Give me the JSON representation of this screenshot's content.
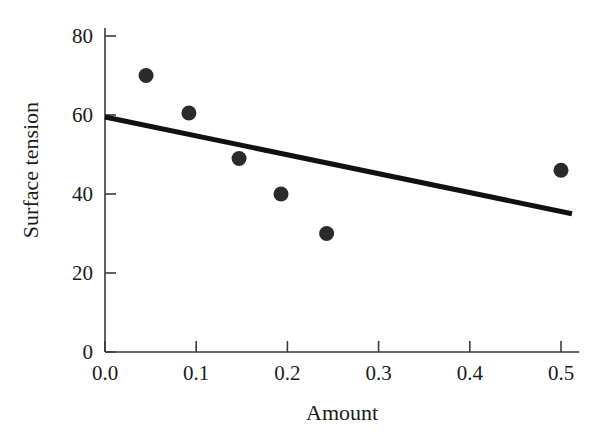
{
  "chart_data": {
    "type": "scatter",
    "title": "",
    "xlabel": "Amount",
    "ylabel": "Surface tension",
    "xlim": [
      0.0,
      0.52
    ],
    "ylim": [
      0,
      82
    ],
    "grid": false,
    "legend": "none",
    "x_ticks": [
      "0.0",
      "0.1",
      "0.2",
      "0.3",
      "0.4",
      "0.5"
    ],
    "x_tick_values": [
      0.0,
      0.1,
      0.2,
      0.3,
      0.4,
      0.5
    ],
    "y_ticks": [
      "0",
      "20",
      "40",
      "60",
      "80"
    ],
    "y_tick_values": [
      0,
      20,
      40,
      60,
      80
    ],
    "series": [
      {
        "name": "observations",
        "type": "scatter",
        "marker": "filled-circle",
        "color": "#2b2b2b",
        "points": [
          {
            "x": 0.045,
            "y": 70
          },
          {
            "x": 0.092,
            "y": 60.5
          },
          {
            "x": 0.147,
            "y": 49
          },
          {
            "x": 0.193,
            "y": 40
          },
          {
            "x": 0.243,
            "y": 30
          },
          {
            "x": 0.5,
            "y": 46
          }
        ]
      },
      {
        "name": "fitted-line",
        "type": "line",
        "color": "#111111",
        "x_start": 0.0,
        "y_start": 59.5,
        "x_end": 0.512,
        "y_end": 35.0
      }
    ]
  },
  "axes": {
    "x_title": "Amount",
    "y_title": "Surface tension"
  }
}
